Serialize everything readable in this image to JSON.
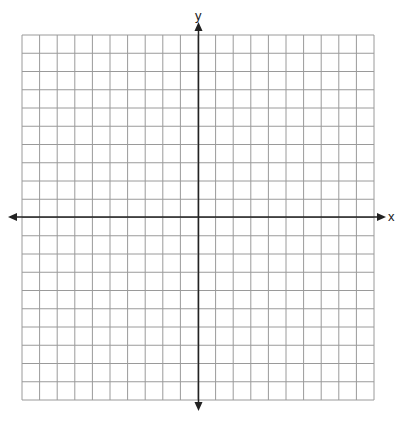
{
  "diagram": {
    "type": "coordinate-plane",
    "x_label": "x",
    "y_label": "y",
    "grid": {
      "columns": 20,
      "rows": 20,
      "left": 22,
      "top": 35,
      "right": 374,
      "bottom": 400,
      "line_color": "#9a9a9a",
      "border_color": "#8a8a8a"
    },
    "axes": {
      "origin_x": 198.5,
      "origin_y": 217,
      "x_start": 8,
      "x_end": 386,
      "y_start": 22,
      "y_end": 411,
      "color": "#222222"
    }
  }
}
